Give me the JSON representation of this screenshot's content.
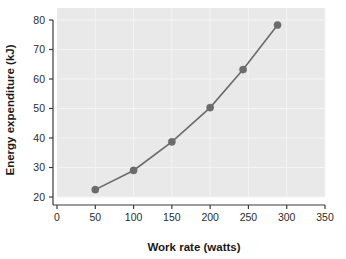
{
  "chart_data": {
    "type": "line",
    "title": "",
    "xlabel": "Work rate (watts)",
    "ylabel": "Energy expenditure (kJ)",
    "xlim": [
      0,
      350
    ],
    "ylim": [
      20,
      80
    ],
    "xticks": [
      0,
      50,
      100,
      150,
      200,
      250,
      300,
      350
    ],
    "yticks": [
      20,
      30,
      40,
      50,
      60,
      70,
      80
    ],
    "grid": true,
    "legend": "none",
    "marker": "circle",
    "marker_color": "#6b6b6b",
    "line_color": "#6b6b6b",
    "panel_color": "#e9e9e9",
    "series": [
      {
        "name": "Energy expenditure",
        "x": [
          50,
          100,
          150,
          200,
          243,
          288
        ],
        "values": [
          22.5,
          29.0,
          38.7,
          50.3,
          63.2,
          78.3
        ]
      }
    ]
  },
  "ticks": {
    "x": [
      "0",
      "50",
      "100",
      "150",
      "200",
      "250",
      "300",
      "350"
    ],
    "y": [
      "20",
      "30",
      "40",
      "50",
      "60",
      "70",
      "80"
    ]
  },
  "labels": {
    "x_axis_title": "Work rate (watts)",
    "y_axis_title": "Energy expenditure (kJ)"
  }
}
